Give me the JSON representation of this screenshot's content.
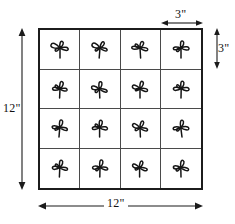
{
  "figure": {
    "grid": {
      "rows": 4,
      "columns": 4,
      "cell_icon": "plant-seedling-icon",
      "cells": [
        {
          "row": 1,
          "col": 1,
          "content": "plant-seedling-icon"
        },
        {
          "row": 1,
          "col": 2,
          "content": "plant-seedling-icon"
        },
        {
          "row": 1,
          "col": 3,
          "content": "plant-seedling-icon"
        },
        {
          "row": 1,
          "col": 4,
          "content": "plant-seedling-icon"
        },
        {
          "row": 2,
          "col": 1,
          "content": "plant-seedling-icon"
        },
        {
          "row": 2,
          "col": 2,
          "content": "plant-seedling-icon"
        },
        {
          "row": 2,
          "col": 3,
          "content": "plant-seedling-icon"
        },
        {
          "row": 2,
          "col": 4,
          "content": "plant-seedling-icon"
        },
        {
          "row": 3,
          "col": 1,
          "content": "plant-seedling-icon"
        },
        {
          "row": 3,
          "col": 2,
          "content": "plant-seedling-icon"
        },
        {
          "row": 3,
          "col": 3,
          "content": "plant-seedling-icon"
        },
        {
          "row": 3,
          "col": 4,
          "content": "plant-seedling-icon"
        },
        {
          "row": 4,
          "col": 1,
          "content": "plant-seedling-icon"
        },
        {
          "row": 4,
          "col": 2,
          "content": "plant-seedling-icon"
        },
        {
          "row": 4,
          "col": 3,
          "content": "plant-seedling-icon"
        },
        {
          "row": 4,
          "col": 4,
          "content": "plant-seedling-icon"
        }
      ]
    },
    "dimensions": {
      "left_height": "12\"",
      "bottom_width": "12\"",
      "cell_width": "3\"",
      "cell_height": "3\""
    },
    "colors": {
      "outline": "#1c1c1c",
      "gridline": "#4a4a4a",
      "background": "#ffffff",
      "plant_stroke": "#151515"
    }
  }
}
